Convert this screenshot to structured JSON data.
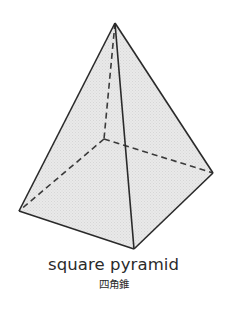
{
  "diagram": {
    "shape": "square pyramid",
    "vertices": {
      "apex": [
        115,
        23
      ],
      "base_left": [
        19,
        211
      ],
      "base_front": [
        134,
        249
      ],
      "base_right": [
        213,
        173
      ],
      "base_back_hidden": [
        104,
        139
      ]
    },
    "colors": {
      "fill": "#e6e6e6",
      "edge": "#2a2a2a",
      "hidden_edge": "#3a3a3a",
      "background": "#ffffff"
    }
  },
  "caption": {
    "english": "square pyramid",
    "japanese": "四角錐"
  }
}
